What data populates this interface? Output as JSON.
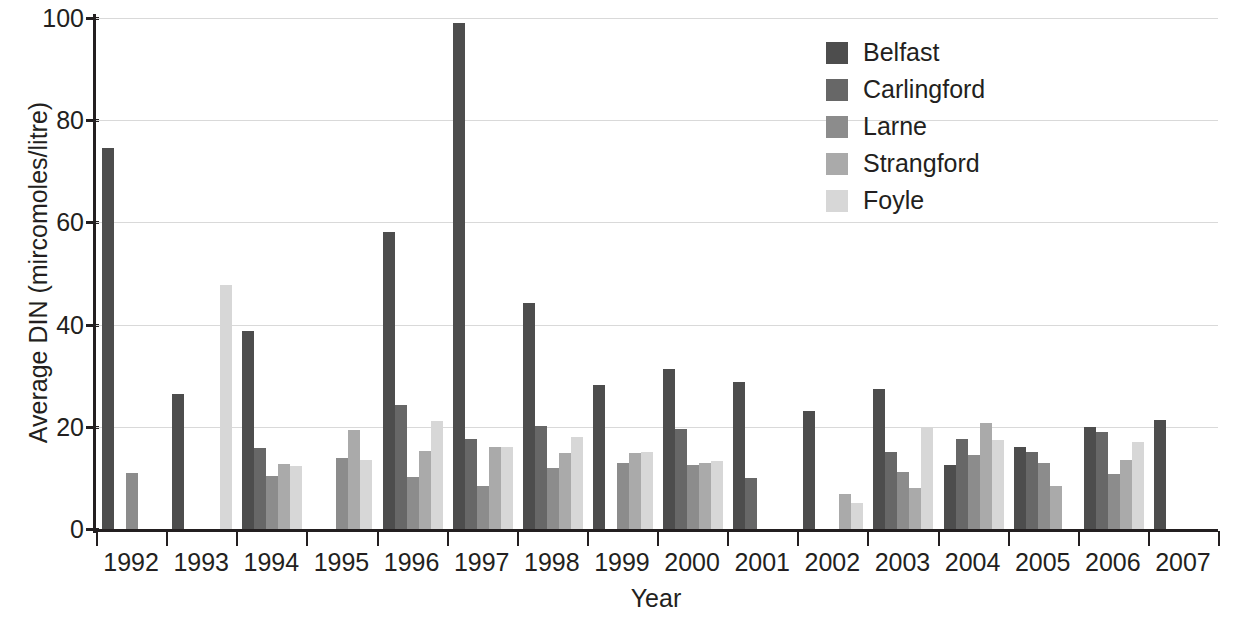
{
  "chart_data": {
    "type": "bar",
    "title": "",
    "xlabel": "Year",
    "ylabel": "Average DIN (mircomoles/litre)",
    "ylim": [
      0,
      100
    ],
    "ytick_labels": [
      "0",
      "20",
      "40",
      "60",
      "80",
      "100"
    ],
    "ytick_values": [
      0,
      20,
      40,
      60,
      80,
      100
    ],
    "grid": true,
    "legend_position": "top-right",
    "categories": [
      "1992",
      "1993",
      "1994",
      "1995",
      "1996",
      "1997",
      "1998",
      "1999",
      "2000",
      "2001",
      "2002",
      "2003",
      "2004",
      "2005",
      "2006",
      "2007"
    ],
    "series": [
      {
        "name": "Belfast",
        "color": "#4d4d4d",
        "values": [
          74.5,
          26.5,
          38.8,
          null,
          58.2,
          99.0,
          44.2,
          28.2,
          31.3,
          28.7,
          23.0,
          27.4,
          12.5,
          16.0,
          20.0,
          21.4
        ]
      },
      {
        "name": "Carlingford",
        "color": "#676767",
        "values": [
          null,
          null,
          15.8,
          null,
          24.3,
          17.6,
          20.2,
          null,
          19.5,
          9.9,
          null,
          15.0,
          17.6,
          15.0,
          19.0,
          null
        ]
      },
      {
        "name": "Larne",
        "color": "#8c8c8c",
        "values": [
          11.0,
          null,
          10.3,
          13.8,
          10.1,
          8.5,
          11.9,
          13.0,
          12.5,
          null,
          null,
          11.2,
          14.4,
          13.0,
          10.8,
          null
        ]
      },
      {
        "name": "Strangford",
        "color": "#aaaaaa",
        "values": [
          null,
          null,
          12.7,
          19.4,
          15.3,
          16.0,
          14.8,
          14.9,
          12.9,
          null,
          6.8,
          8.0,
          20.8,
          8.4,
          13.5,
          null
        ]
      },
      {
        "name": "Foyle",
        "color": "#d7d7d7",
        "values": [
          null,
          47.8,
          12.4,
          13.6,
          21.2,
          16.0,
          18.0,
          15.0,
          13.4,
          null,
          5.0,
          19.9,
          17.4,
          null,
          17.0,
          null
        ]
      }
    ]
  },
  "legend": {
    "items": [
      {
        "label": "Belfast"
      },
      {
        "label": "Carlingford"
      },
      {
        "label": "Larne"
      },
      {
        "label": "Strangford"
      },
      {
        "label": "Foyle"
      }
    ]
  },
  "axes": {
    "x_title": "Year",
    "y_title": "Average DIN (mircomoles/litre)"
  },
  "colors": {
    "gridline": "#d9d9d9",
    "axis": "#231f20",
    "text": "#231f20",
    "background": "#ffffff"
  }
}
